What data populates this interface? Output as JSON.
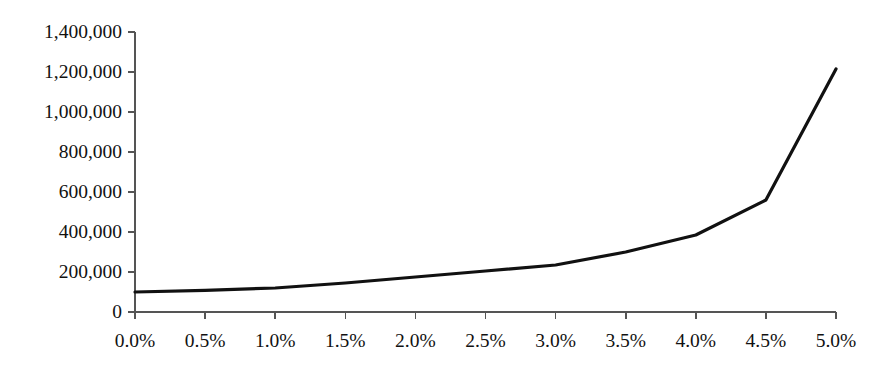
{
  "chart_data": {
    "type": "line",
    "title": "",
    "subtitle": "",
    "xlabel": "",
    "ylabel": "",
    "x": [
      0.0,
      0.5,
      1.0,
      1.5,
      2.0,
      2.5,
      3.0,
      3.5,
      4.0,
      4.5,
      5.0
    ],
    "x_tick_labels": [
      "0.0%",
      "0.5%",
      "1.0%",
      "1.5%",
      "2.0%",
      "2.5%",
      "3.0%",
      "3.5%",
      "4.0%",
      "4.5%",
      "5.0%"
    ],
    "y_tick_labels": [
      "1,400,000",
      "1,200,000",
      "1,000,000",
      "800,000",
      "600,000",
      "400,000",
      "200,000",
      "0"
    ],
    "y_tick_values": [
      1400000,
      1200000,
      1000000,
      800000,
      600000,
      400000,
      200000,
      0
    ],
    "values": [
      100000,
      108000,
      120000,
      145000,
      175000,
      205000,
      235000,
      300000,
      385000,
      560000,
      1215000
    ],
    "series": [
      {
        "name": "series-1",
        "values": [
          100000,
          108000,
          120000,
          145000,
          175000,
          205000,
          235000,
          300000,
          385000,
          560000,
          1215000
        ]
      }
    ],
    "xlim": [
      0.0,
      5.0
    ],
    "ylim": [
      0,
      1400000
    ],
    "grid": false,
    "legend": false,
    "legend_position": "none",
    "line_color": "#111111",
    "axis_color": "#555555",
    "background_color": "#ffffff",
    "line_width": 3.2,
    "annotations": []
  },
  "plot_geometry": {
    "left": 135,
    "right": 836,
    "top": 32,
    "bottom": 312,
    "y_axis_top_value": 1400000,
    "y_axis_bottom_value": 0,
    "tick_length": 7
  }
}
